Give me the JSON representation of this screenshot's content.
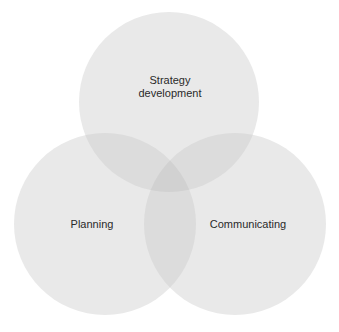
{
  "diagram": {
    "type": "venn",
    "circles": [
      {
        "id": "strategy",
        "label_lines": [
          "Strategy",
          "development"
        ],
        "cx": 169,
        "cy": 102,
        "r": 90
      },
      {
        "id": "planning",
        "label_lines": [
          "Planning"
        ],
        "cx": 105,
        "cy": 224,
        "r": 91
      },
      {
        "id": "communicating",
        "label_lines": [
          "Communicating"
        ],
        "cx": 235,
        "cy": 224,
        "r": 91
      }
    ],
    "colors": {
      "circle_fill": "#e9e9e9",
      "overlap_fill": "#dcdcdc",
      "center_fill": "#d1d1d1",
      "text": "#2a2a2a",
      "background": "#ffffff"
    }
  }
}
